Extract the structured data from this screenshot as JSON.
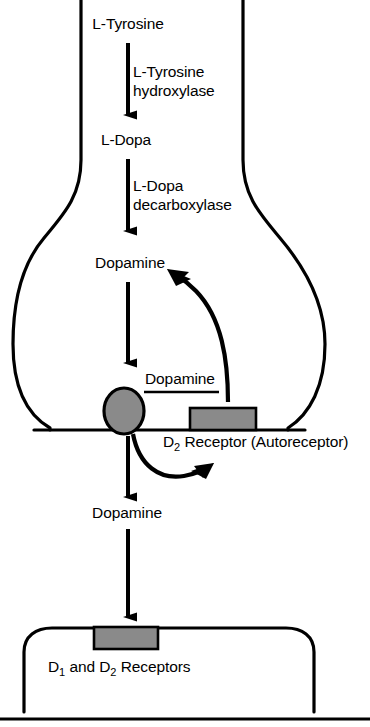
{
  "diagram": {
    "type": "biological-pathway",
    "colors": {
      "stroke": "#000000",
      "fill_white": "#ffffff",
      "vesicle_fill": "#8a8a8a",
      "receptor_fill": "#8a8a8a",
      "background": "#ffffff"
    },
    "presynaptic_neuron": {
      "label": "presynaptic nerve terminal",
      "steps": [
        {
          "id": "l-tyrosine",
          "label": "L-Tyrosine"
        },
        {
          "id": "l-dopa",
          "label": "L-Dopa"
        },
        {
          "id": "dopamine-cytosolic",
          "label": "Dopamine"
        }
      ],
      "enzymes": [
        {
          "id": "tyrosine-hydroxylase",
          "line1": "L-Tyrosine",
          "line2": "hydroxylase"
        },
        {
          "id": "dopa-decarboxylase",
          "line1": "L-Dopa",
          "line2": "decarboxylase"
        }
      ],
      "vesicle": {
        "label": "Dopamine",
        "name": "dopamine-vesicle"
      },
      "autoreceptor": {
        "name": "d2-autoreceptor",
        "label_main": "D",
        "label_sub": "2",
        "label_rest": " Receptor (Autoreceptor)"
      }
    },
    "synapse": {
      "released_transmitter": "Dopamine"
    },
    "postsynaptic_neuron": {
      "label_part1": "D",
      "label_sub1": "1",
      "label_mid": " and D",
      "label_sub2": "2",
      "label_part2": " Receptors",
      "receptor_name": "postsynaptic-receptor-block"
    }
  }
}
